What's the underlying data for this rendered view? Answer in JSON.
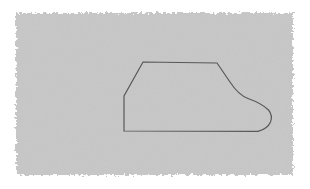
{
  "canvas": {
    "width": 310,
    "height": 189,
    "background_color": "#ffffff",
    "kind": "scanned-figure"
  },
  "panel": {
    "name": "gray-scan-panel",
    "fill_color": "#c6c7c6",
    "edge_style": "rough-feathered",
    "x": 16,
    "y": 13,
    "width": 277,
    "height": 162,
    "noise_opacity": 0.1
  },
  "shape": {
    "name": "boot-outline",
    "description": "closed outline resembling a boot or sock profile",
    "stroke_color": "#585858",
    "stroke_width": 1.2,
    "fill": "none",
    "path": "M 143.0 62.0 L 217.0 63.0 L 230.0 82.0 Q 238.5 95.0 248.0 98.5 Q 262.0 103.5 268.5 110.0 Q 273.0 115.5 270.5 122.0 Q 267.5 129.0 258.0 131.4 L 124.0 131.0 L 124.0 96.0 Z",
    "vertices": [
      {
        "name": "top-left-corner",
        "x": 143,
        "y": 62
      },
      {
        "name": "top-right-corner",
        "x": 217,
        "y": 63
      },
      {
        "name": "right-diagonal-end",
        "x": 238,
        "y": 95
      },
      {
        "name": "toe-rightmost",
        "x": 271,
        "y": 114
      },
      {
        "name": "bottom-right-corner",
        "x": 258,
        "y": 131
      },
      {
        "name": "bottom-left-corner",
        "x": 124,
        "y": 131
      },
      {
        "name": "left-vertical-top",
        "x": 124,
        "y": 96
      }
    ]
  },
  "labels": {
    "none_visible": ""
  }
}
